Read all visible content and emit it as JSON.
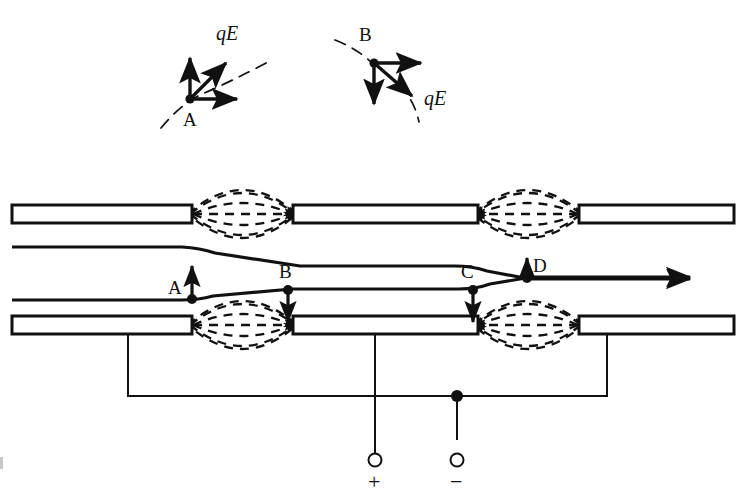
{
  "figure": {
    "colors": {
      "ink": "#111111",
      "background": "#ffffff",
      "tube_fill": "#ffffff",
      "field_line": "#1a1a1a"
    }
  },
  "insets": [
    {
      "name": "inset-A",
      "point_label": "A",
      "force_label": "qE",
      "vectors": [
        "up",
        "diagonal-up-right",
        "right"
      ],
      "trajectory": "dashed-arc-rising"
    },
    {
      "name": "inset-B",
      "point_label": "B",
      "force_label": "qE",
      "vectors": [
        "right",
        "down",
        "diagonal-down-right"
      ],
      "trajectory": "dashed-arc-falling"
    }
  ],
  "markers": [
    {
      "label": "A",
      "arrow": "up",
      "label_side": "left"
    },
    {
      "label": "B",
      "arrow": "down",
      "label_side": "above"
    },
    {
      "label": "C",
      "arrow": "down",
      "label_side": "above-left"
    },
    {
      "label": "D",
      "arrow": "up",
      "label_side": "right"
    }
  ],
  "terminals": [
    {
      "name": "positive-terminal",
      "symbol": "+"
    },
    {
      "name": "negative-terminal",
      "symbol": "−"
    }
  ],
  "gaps": [
    {
      "name": "gap-upper-left",
      "field_direction": "right"
    },
    {
      "name": "gap-upper-right",
      "field_direction": "left"
    },
    {
      "name": "gap-lower-left",
      "field_direction": "right"
    },
    {
      "name": "gap-lower-right",
      "field_direction": "left"
    }
  ],
  "trajectories": [
    {
      "name": "upper-beam-trajectory",
      "direction": "left-to-right"
    },
    {
      "name": "lower-beam-trajectory",
      "direction": "left-to-right"
    }
  ]
}
